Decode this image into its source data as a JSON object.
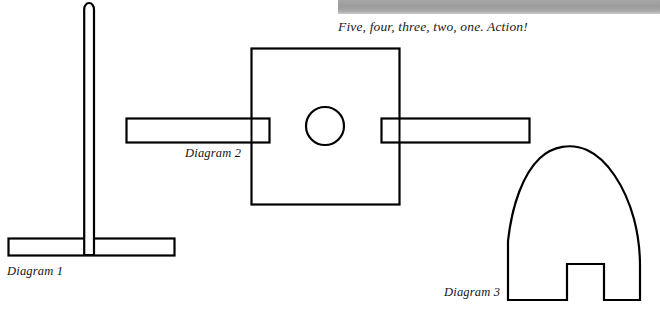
{
  "page": {
    "width": 660,
    "height": 313,
    "background_color": "#ffffff",
    "ink_color": "#000000"
  },
  "header": {
    "gray_bar": {
      "name": "gray-rule-bar",
      "color": "#9b9b9b",
      "x": 338,
      "y": 0,
      "width": 322,
      "height": 14
    },
    "caption": "Five, four, three, two, one. Action!"
  },
  "figures": [
    {
      "id": "diagram-1",
      "label": "Diagram 1",
      "shape": "tee-bar",
      "description": "Vertical rod with rounded top mounted on a horizontal base bar",
      "parts": [
        {
          "name": "vertical-rod",
          "x": 84,
          "y": 3,
          "width": 10,
          "height": 252,
          "top": "rounded"
        },
        {
          "name": "base-bar",
          "x": 8,
          "y": 238,
          "width": 167,
          "height": 18
        }
      ]
    },
    {
      "id": "diagram-2",
      "label": "Diagram 2",
      "shape": "square-with-circle-and-arms",
      "description": "Square plate with a centered circular hole and two horizontal bars entering from left and right",
      "parts": [
        {
          "name": "square-plate",
          "x": 251,
          "y": 48,
          "width": 149,
          "height": 157
        },
        {
          "name": "center-circle",
          "cx": 325,
          "cy": 126,
          "r": 19
        },
        {
          "name": "left-arm-bar",
          "x": 126,
          "y": 118,
          "width": 144,
          "height": 25
        },
        {
          "name": "right-arm-bar",
          "x": 381,
          "y": 118,
          "width": 149,
          "height": 25
        }
      ]
    },
    {
      "id": "diagram-3",
      "label": "Diagram 3",
      "shape": "arch-with-notch",
      "description": "Dome/arch outline with a rectangular notch cut from the bottom center",
      "parts": [
        {
          "name": "arch-body",
          "left": 507,
          "right": 640,
          "bottom": 300,
          "apex_y": 148
        },
        {
          "name": "bottom-notch",
          "x": 566,
          "y": 263,
          "width": 38,
          "height": 37
        }
      ]
    }
  ]
}
